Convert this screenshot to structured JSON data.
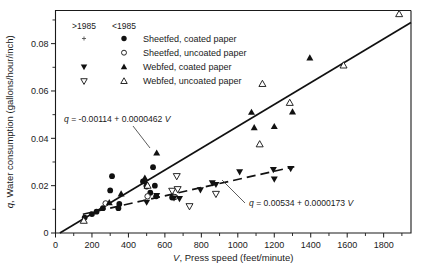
{
  "chart_data": {
    "type": "scatter",
    "title": "",
    "xlabel": "V, Press speed (feet/minute)",
    "ylabel": "q, Water consumption (gallons/hour/inch)",
    "xlim": [
      0,
      1950
    ],
    "ylim": [
      0,
      0.094
    ],
    "xticks": [
      0,
      200,
      400,
      600,
      800,
      1000,
      1200,
      1400,
      1600,
      1800
    ],
    "xticklabels": [
      "0",
      "200",
      "400",
      "600",
      "800",
      "1000",
      "1200",
      "1400",
      "1600",
      "1800"
    ],
    "yticks": [
      0,
      0.02,
      0.04,
      0.06,
      0.08
    ],
    "yticklabels": [
      "0",
      "0.02",
      "0.04",
      "0.06",
      "0.08"
    ],
    "y_minor_ticks": [
      0.01,
      0.03,
      0.05,
      0.07,
      0.09
    ],
    "x_minor_ticks": [
      100,
      300,
      500,
      700,
      900,
      1100,
      1300,
      1500,
      1700,
      1900
    ],
    "grid": false,
    "legend_position": "upper-left-inside",
    "legend_headers": [
      "&gt;1985",
      "&lt;1985"
    ],
    "legend_entries": [
      {
        "label": "Sheetfed, coated paper",
        "marker_old": "plus",
        "marker_new": "filled-circle"
      },
      {
        "label": "Sheetfed, uncoated paper",
        "marker_old": "none",
        "marker_new": "open-circle"
      },
      {
        "label": "Webfed, coated paper",
        "marker_old": "filled-down-triangle",
        "marker_new": "filled-up-triangle"
      },
      {
        "label": "Webfed, uncoated paper",
        "marker_old": "open-down-triangle",
        "marker_new": "open-up-triangle"
      }
    ],
    "annotations": [
      {
        "name": "solid-fit-equation",
        "text_parts": [
          "q",
          " = -0.00114 + 0.0000462 ",
          "V"
        ],
        "text": "q = -0.00114 + 0.0000462 V"
      },
      {
        "name": "dashed-fit-equation",
        "text_parts": [
          "q",
          " = 0.00534 + 0.0000173 ",
          "V"
        ],
        "text": "q = 0.00534 + 0.0000173 V"
      }
    ],
    "fit_lines": [
      {
        "name": "sheetfed-coated-fit",
        "style": "solid",
        "intercept": -0.00114,
        "slope": 4.62e-05,
        "x_start": 24,
        "x_end": 1950,
        "equation": "q = -0.00114 + 0.0000462 V"
      },
      {
        "name": "webfed-fit",
        "style": "dashed",
        "intercept": 0.00534,
        "slope": 1.73e-05,
        "x_start": 150,
        "x_end": 1310,
        "equation": "q = 0.00534 + 0.0000173 V"
      }
    ],
    "series": [
      {
        "name": "Sheetfed, coated paper",
        "marker": "filled-circle",
        "points": [
          [
            160,
            0.0065
          ],
          [
            200,
            0.008
          ],
          [
            225,
            0.009
          ],
          [
            260,
            0.0105
          ],
          [
            300,
            0.018
          ],
          [
            310,
            0.024
          ],
          [
            345,
            0.0105
          ],
          [
            350,
            0.0123
          ],
          [
            480,
            0.0218
          ],
          [
            500,
            0.0196
          ],
          [
            520,
            0.017
          ],
          [
            535,
            0.0278
          ],
          [
            545,
            0.02
          ],
          [
            552,
            0.0155
          ],
          [
            640,
            0.015
          ]
        ]
      },
      {
        "name": "Sheetfed, uncoated paper",
        "marker": "open-circle",
        "points": [
          [
            275,
            0.0125
          ],
          [
            505,
            0.0155
          ],
          [
            655,
            0.0152
          ]
        ]
      },
      {
        "name": "Webfed, coated paper",
        "marker": "filled-up-triangle",
        "points": [
          [
            295,
            0.0128
          ],
          [
            360,
            0.0165
          ],
          [
            490,
            0.0232
          ],
          [
            500,
            0.0208
          ],
          [
            555,
            0.0338
          ],
          [
            1075,
            0.051
          ],
          [
            1090,
            0.0445
          ],
          [
            1200,
            0.045
          ],
          [
            1300,
            0.0512
          ],
          [
            1395,
            0.074
          ]
        ]
      },
      {
        "name": "Webfed, uncoated paper",
        "marker": "open-up-triangle",
        "points": [
          [
            155,
            0.0052
          ],
          [
            505,
            0.02
          ],
          [
            1120,
            0.0375
          ],
          [
            1135,
            0.063
          ],
          [
            1285,
            0.055
          ],
          [
            1580,
            0.0708
          ],
          [
            1885,
            0.0925
          ]
        ]
      },
      {
        "name": "Webfed, coated paper (pre-1985)",
        "marker": "filled-down-triangle",
        "points": [
          [
            500,
            0.013
          ],
          [
            555,
            0.0158
          ],
          [
            650,
            0.0148
          ],
          [
            680,
            0.0145
          ],
          [
            795,
            0.0182
          ],
          [
            860,
            0.0212
          ],
          [
            880,
            0.0205
          ],
          [
            1010,
            0.0258
          ],
          [
            1195,
            0.0268
          ],
          [
            1200,
            0.0228
          ],
          [
            1290,
            0.0272
          ]
        ]
      },
      {
        "name": "Webfed, uncoated paper (pre-1985)",
        "marker": "open-down-triangle",
        "points": [
          [
            640,
            0.0178
          ],
          [
            665,
            0.024
          ],
          [
            670,
            0.0185
          ],
          [
            735,
            0.0113
          ],
          [
            880,
            0.0165
          ]
        ]
      }
    ]
  },
  "caption": {
    "text": ""
  },
  "colors": {
    "foreground": "#111111",
    "background": "#ffffff"
  }
}
